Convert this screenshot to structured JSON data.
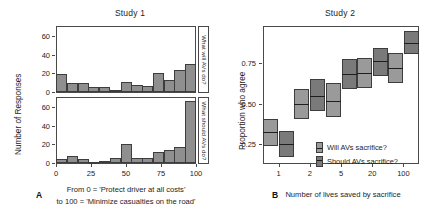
{
  "figure": {
    "panelA": {
      "letter": "A",
      "title": "Study 1",
      "ylabel": "Number of Responses",
      "caption_line1": "From 0 = 'Protect driver at all costs'",
      "caption_line2": "to 100 = 'Minimize casualties on the road'",
      "strip_top": "What will AVs do?",
      "strip_bottom": "What should AVs do?",
      "xticks": [
        "0",
        "25",
        "50",
        "75",
        "100"
      ],
      "yticks": [
        "0",
        "20",
        "40",
        "60"
      ]
    },
    "panelB": {
      "letter": "B",
      "title": "Study 2",
      "ylabel": "Proportion who agree",
      "xlabel": "Number of lives saved by sacrifice",
      "xticks": [
        "1",
        "2",
        "5",
        "20",
        "100"
      ],
      "yticks": [
        "0.25",
        "0.50",
        "0.75"
      ],
      "legend": [
        {
          "key": "light",
          "label": "Will AVs sacrifice?"
        },
        {
          "key": "dark",
          "label": "Should AVs sacrifice?"
        }
      ]
    },
    "colors": {
      "bar_fill": "#8f8f8f",
      "bar_stroke": "#3d3d3d",
      "box_light": "#9a9a9a",
      "box_dark": "#7a7a7a",
      "median": "#1e1e1e",
      "axis": "#4a4a4a",
      "text": "#1d1d1d",
      "background": "#ffffff"
    }
  },
  "chart_data": [
    {
      "type": "bar",
      "id": "study1-will",
      "title": "Study 1",
      "panel_label": "What will AVs do?",
      "xlabel": "From 0 = 'Protect driver at all costs' to 100 = 'Minimize casualties on the road'",
      "ylabel": "Number of Responses",
      "xlim": [
        0,
        100
      ],
      "ylim": [
        0,
        70
      ],
      "yticks": [
        0,
        20,
        40,
        60
      ],
      "xticks": [
        0,
        25,
        50,
        75,
        100
      ],
      "grid": false,
      "bin_width": 7.7,
      "bin_centers": [
        3.8,
        11.5,
        19.2,
        26.9,
        34.6,
        42.3,
        50.0,
        57.7,
        65.4,
        73.1,
        80.8,
        88.5,
        96.2
      ],
      "values": [
        19,
        10,
        10,
        5,
        5,
        2,
        11,
        8,
        6,
        21,
        13,
        24,
        30
      ]
    },
    {
      "type": "bar",
      "id": "study1-should",
      "title": "Study 1",
      "panel_label": "What should AVs do?",
      "xlabel": "From 0 = 'Protect driver at all costs' to 100 = 'Minimize casualties on the road'",
      "ylabel": "Number of Responses",
      "xlim": [
        0,
        100
      ],
      "ylim": [
        0,
        70
      ],
      "yticks": [
        0,
        20,
        40,
        60
      ],
      "xticks": [
        0,
        25,
        50,
        75,
        100
      ],
      "grid": false,
      "bin_width": 7.7,
      "bin_centers": [
        3.8,
        11.5,
        19.2,
        26.9,
        34.6,
        42.3,
        50.0,
        57.7,
        65.4,
        73.1,
        80.8,
        88.5,
        96.2
      ],
      "values": [
        4,
        8,
        4,
        1,
        2,
        5,
        21,
        5,
        5,
        12,
        14,
        17,
        67
      ]
    },
    {
      "type": "bar",
      "id": "study2",
      "title": "Study 2",
      "xlabel": "Number of lives saved by sacrifice",
      "ylabel": "Proportion who agree",
      "categories": [
        "1",
        "2",
        "5",
        "20",
        "100"
      ],
      "ylim": [
        0.12,
        0.95
      ],
      "yticks": [
        0.25,
        0.5,
        0.75
      ],
      "grid": false,
      "note": "Paired interval boxes with median line; lower/upper are confidence interval bounds",
      "series": [
        {
          "name": "Will AVs sacrifice?",
          "key": "light",
          "values": [
            0.31,
            0.48,
            0.5,
            0.67,
            0.7
          ],
          "lower": [
            0.23,
            0.39,
            0.4,
            0.58,
            0.61
          ],
          "upper": [
            0.39,
            0.57,
            0.61,
            0.76,
            0.79
          ]
        },
        {
          "name": "Should AVs sacrifice?",
          "key": "dark",
          "values": [
            0.24,
            0.53,
            0.66,
            0.74,
            0.85
          ],
          "lower": [
            0.16,
            0.44,
            0.57,
            0.65,
            0.78
          ],
          "upper": [
            0.32,
            0.63,
            0.75,
            0.82,
            0.92
          ]
        }
      ]
    }
  ]
}
